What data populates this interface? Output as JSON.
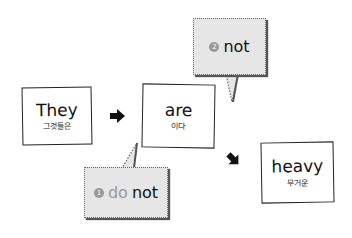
{
  "words": [
    {
      "en": "They",
      "ko": "그것들은"
    },
    {
      "en": "are",
      "ko": "이다"
    },
    {
      "en": "heavy",
      "ko": "무거운"
    }
  ],
  "bubbles": [
    {
      "number": "1",
      "prefix": "do",
      "word": "not"
    },
    {
      "number": "2",
      "word": "not"
    }
  ],
  "colors": {
    "bubble_fill": "#e6e6e6",
    "number_badge": "#999999",
    "border": "#222222"
  }
}
